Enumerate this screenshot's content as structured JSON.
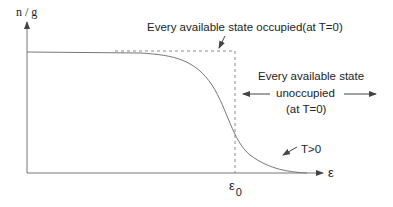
{
  "diagram": {
    "y_axis_label": "n / g",
    "x_axis_label": "ε",
    "x_marker_label": "ε",
    "x_marker_subscript": "0",
    "occupied_annotation": "Every available state occupied(at T=0)",
    "unoccupied_annotation": {
      "line1": "Every available state",
      "line2": "unoccupied",
      "line3": "(at T=0)"
    },
    "curve_label": "T>0",
    "colors": {
      "axis": "#777777",
      "curve": "#777777",
      "dashed": "#888888",
      "text": "#222222"
    }
  }
}
